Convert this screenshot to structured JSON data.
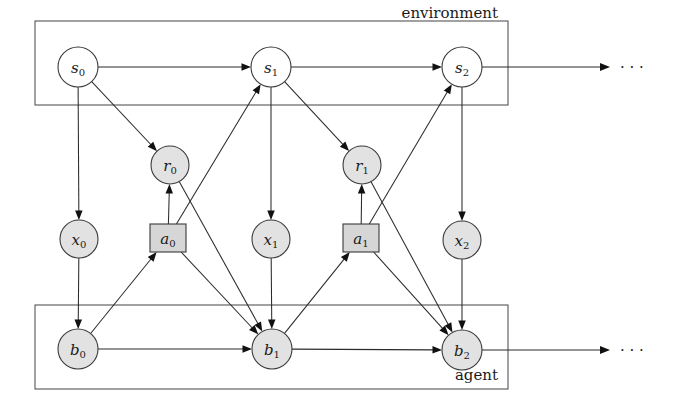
{
  "diagram": {
    "canvas": {
      "width": 675,
      "height": 419
    },
    "colors": {
      "shaded_node_fill": "#e2e2e2",
      "unshaded_node_fill": "#ffffff",
      "action_node_fill": "#d6d6d6",
      "stroke": "#2b2b2b",
      "plate_stroke": "#555555",
      "background": "#ffffff"
    },
    "plates": [
      {
        "id": "environment",
        "label": "environment",
        "label_anchor": "top-right",
        "x": 35,
        "y": 21,
        "width": 473,
        "height": 84
      },
      {
        "id": "agent",
        "label": "agent",
        "label_anchor": "bottom-right",
        "x": 35,
        "y": 305,
        "width": 473,
        "height": 84
      }
    ],
    "nodes": [
      {
        "id": "s0",
        "base": "s",
        "sub": "0",
        "shape": "circle",
        "shaded": false,
        "cx": 78,
        "cy": 67,
        "r": 20
      },
      {
        "id": "s1",
        "base": "s",
        "sub": "1",
        "shape": "circle",
        "shaded": false,
        "cx": 271,
        "cy": 67,
        "r": 20
      },
      {
        "id": "s2",
        "base": "s",
        "sub": "2",
        "shape": "circle",
        "shaded": false,
        "cx": 462,
        "cy": 67,
        "r": 20
      },
      {
        "id": "r0",
        "base": "r",
        "sub": "0",
        "shape": "circle",
        "shaded": true,
        "cx": 170,
        "cy": 165,
        "r": 19
      },
      {
        "id": "r1",
        "base": "r",
        "sub": "1",
        "shape": "circle",
        "shaded": true,
        "cx": 362,
        "cy": 165,
        "r": 19
      },
      {
        "id": "x0",
        "base": "x",
        "sub": "0",
        "shape": "circle",
        "shaded": true,
        "cx": 79,
        "cy": 239,
        "r": 19
      },
      {
        "id": "x1",
        "base": "x",
        "sub": "1",
        "shape": "circle",
        "shaded": true,
        "cx": 271,
        "cy": 239,
        "r": 19
      },
      {
        "id": "x2",
        "base": "x",
        "sub": "2",
        "shape": "circle",
        "shaded": true,
        "cx": 462,
        "cy": 240,
        "r": 19
      },
      {
        "id": "a0",
        "base": "a",
        "sub": "0",
        "shape": "rect",
        "shaded": true,
        "cx": 168,
        "cy": 238,
        "w": 36,
        "h": 28
      },
      {
        "id": "a1",
        "base": "a",
        "sub": "1",
        "shape": "rect",
        "shaded": true,
        "cx": 361,
        "cy": 238,
        "w": 36,
        "h": 28
      },
      {
        "id": "b0",
        "base": "b",
        "sub": "0",
        "shape": "circle",
        "shaded": true,
        "cx": 78,
        "cy": 349,
        "r": 20
      },
      {
        "id": "b1",
        "base": "b",
        "sub": "1",
        "shape": "circle",
        "shaded": true,
        "cx": 272,
        "cy": 349,
        "r": 20
      },
      {
        "id": "b2",
        "base": "b",
        "sub": "2",
        "shape": "circle",
        "shaded": true,
        "cx": 462,
        "cy": 350,
        "r": 20
      }
    ],
    "edges": [
      {
        "from": "s0",
        "to": "s1",
        "name": "edge-s0-s1"
      },
      {
        "from": "s1",
        "to": "s2",
        "name": "edge-s1-s2"
      },
      {
        "from": "s0",
        "to": "r0",
        "name": "edge-s0-r0"
      },
      {
        "from": "s1",
        "to": "r1",
        "name": "edge-s1-r1"
      },
      {
        "from": "s0",
        "to": "x0",
        "name": "edge-s0-x0"
      },
      {
        "from": "s1",
        "to": "x1",
        "name": "edge-s1-x1"
      },
      {
        "from": "s2",
        "to": "x2",
        "name": "edge-s2-x2"
      },
      {
        "from": "a0",
        "to": "r0",
        "name": "edge-a0-r0"
      },
      {
        "from": "a1",
        "to": "r1",
        "name": "edge-a1-r1"
      },
      {
        "from": "a0",
        "to": "s1",
        "name": "edge-a0-s1"
      },
      {
        "from": "a1",
        "to": "s2",
        "name": "edge-a1-s2"
      },
      {
        "from": "a0",
        "to": "b1",
        "name": "edge-a0-b1"
      },
      {
        "from": "a1",
        "to": "b2",
        "name": "edge-a1-b2"
      },
      {
        "from": "b0",
        "to": "a0",
        "name": "edge-b0-a0"
      },
      {
        "from": "b1",
        "to": "a1",
        "name": "edge-b1-a1"
      },
      {
        "from": "b0",
        "to": "b1",
        "name": "edge-b0-b1"
      },
      {
        "from": "b1",
        "to": "b2",
        "name": "edge-b1-b2"
      },
      {
        "from": "x0",
        "to": "b0",
        "name": "edge-x0-b0"
      },
      {
        "from": "x1",
        "to": "b1",
        "name": "edge-x1-b1"
      },
      {
        "from": "x2",
        "to": "b2",
        "name": "edge-x2-b2"
      },
      {
        "from": "r0",
        "to": "b1",
        "name": "edge-r0-b1"
      },
      {
        "from": "r1",
        "to": "b2",
        "name": "edge-r1-b2"
      }
    ],
    "continuations": [
      {
        "id": "env-continuation",
        "from_x": 482,
        "to_x": 610,
        "y": 67,
        "dots": "· · ·",
        "dots_x": 620
      },
      {
        "id": "agent-continuation",
        "from_x": 482,
        "to_x": 610,
        "y": 350,
        "dots": "· · ·",
        "dots_x": 620
      }
    ],
    "legend_notes": {
      "state_nodes": "s",
      "reward_nodes": "r",
      "observation_nodes": "x",
      "action_nodes": "a",
      "belief_nodes": "b"
    }
  }
}
